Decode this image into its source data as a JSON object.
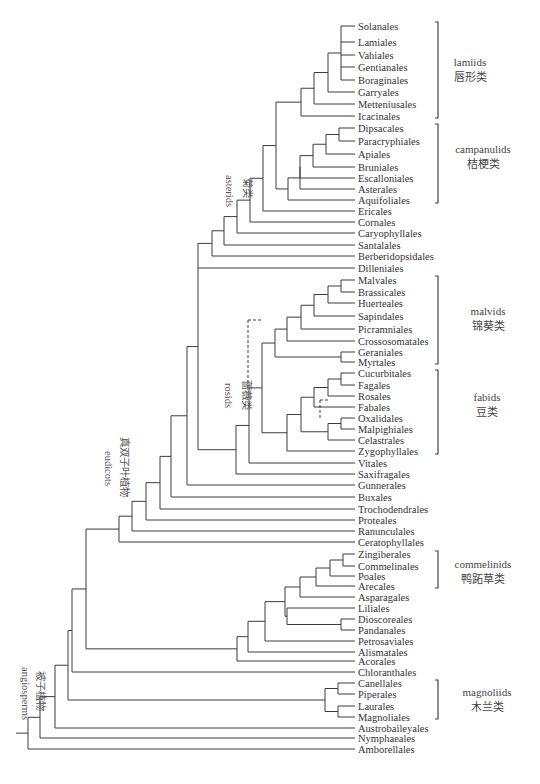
{
  "figure": {
    "type": "phylogenetic_tree",
    "line_color": "#3c3c3c",
    "leaves": [
      {
        "name": "Solanales",
        "y": 26
      },
      {
        "name": "Lamiales",
        "y": 42
      },
      {
        "name": "Vahiales",
        "y": 55
      },
      {
        "name": "Gentianales",
        "y": 67
      },
      {
        "name": "Boraginales",
        "y": 80
      },
      {
        "name": "Garryales",
        "y": 92
      },
      {
        "name": "Metteniusales",
        "y": 104
      },
      {
        "name": "Icacinales",
        "y": 116
      },
      {
        "name": "Dipsacales",
        "y": 128
      },
      {
        "name": "Paracryphiales",
        "y": 141
      },
      {
        "name": "Apiales",
        "y": 154
      },
      {
        "name": "Bruniales",
        "y": 167
      },
      {
        "name": "Escalloniales",
        "y": 178
      },
      {
        "name": "Asterales",
        "y": 189
      },
      {
        "name": "Aquifoliales",
        "y": 200
      },
      {
        "name": "Ericales",
        "y": 211
      },
      {
        "name": "Cornales",
        "y": 222
      },
      {
        "name": "Caryophyllales",
        "y": 233
      },
      {
        "name": "Santalales",
        "y": 245
      },
      {
        "name": "Berberidopsidales",
        "y": 256
      },
      {
        "name": "Dilleniales",
        "y": 268
      },
      {
        "name": "Malvales",
        "y": 280
      },
      {
        "name": "Brassicales",
        "y": 292
      },
      {
        "name": "Huerteales",
        "y": 303
      },
      {
        "name": "Sapindales",
        "y": 316
      },
      {
        "name": "Picramniales",
        "y": 329
      },
      {
        "name": "Crossosomatales",
        "y": 341
      },
      {
        "name": "Geraniales",
        "y": 352
      },
      {
        "name": "Myrtales",
        "y": 362
      },
      {
        "name": "Cucurbitales",
        "y": 373
      },
      {
        "name": "Fagales",
        "y": 385
      },
      {
        "name": "Rosales",
        "y": 396
      },
      {
        "name": "Fabales",
        "y": 407
      },
      {
        "name": "Oxalidales",
        "y": 418
      },
      {
        "name": "Malpighiales",
        "y": 429
      },
      {
        "name": "Celastrales",
        "y": 440
      },
      {
        "name": "Zygophyllales",
        "y": 451
      },
      {
        "name": "Vitales",
        "y": 463
      },
      {
        "name": "Saxifragales",
        "y": 474
      },
      {
        "name": "Gunnerales",
        "y": 485
      },
      {
        "name": "Buxales",
        "y": 497
      },
      {
        "name": "Trochodendrales",
        "y": 509
      },
      {
        "name": "Proteales",
        "y": 520
      },
      {
        "name": "Ranunculales",
        "y": 531
      },
      {
        "name": "Ceratophyllales",
        "y": 542
      },
      {
        "name": "Zingiberales",
        "y": 554
      },
      {
        "name": "Commelinales",
        "y": 566
      },
      {
        "name": "Poales",
        "y": 576
      },
      {
        "name": "Arecales",
        "y": 586
      },
      {
        "name": "Asparagales",
        "y": 597
      },
      {
        "name": "Liliales",
        "y": 608
      },
      {
        "name": "Dioscoreales",
        "y": 619
      },
      {
        "name": "Pandanales",
        "y": 630
      },
      {
        "name": "Petrosaviales",
        "y": 641
      },
      {
        "name": "Alismatales",
        "y": 652
      },
      {
        "name": "Acorales",
        "y": 661
      },
      {
        "name": "Chloranthales",
        "y": 672
      },
      {
        "name": "Canellales",
        "y": 683
      },
      {
        "name": "Piperales",
        "y": 694
      },
      {
        "name": "Laurales",
        "y": 706
      },
      {
        "name": "Magnoliales",
        "y": 717
      },
      {
        "name": "Austrobaileyales",
        "y": 728
      },
      {
        "name": "Nymphaeales",
        "y": 738
      },
      {
        "name": "Amborellales",
        "y": 749
      }
    ],
    "clades": [
      {
        "en": "lamiids",
        "zh": "唇形类",
        "bracket_top": 22,
        "bracket_bottom": 118
      },
      {
        "en": "campanulids",
        "zh": "桔梗类",
        "bracket_top": 124,
        "bracket_bottom": 203
      },
      {
        "en": "malvids",
        "zh": "锦葵类",
        "bracket_top": 276,
        "bracket_bottom": 364
      },
      {
        "en": "fabids",
        "zh": "豆类",
        "bracket_top": 370,
        "bracket_bottom": 454
      },
      {
        "en": "commelinids",
        "zh": "鸭跖草类",
        "bracket_top": 551,
        "bracket_bottom": 588
      },
      {
        "en": "magnoliids",
        "zh": "木兰类",
        "bracket_top": 680,
        "bracket_bottom": 719
      }
    ],
    "node_labels": [
      {
        "en": "asterids",
        "zh": "菊类"
      },
      {
        "en": "rosids",
        "zh": "蔷薇类"
      },
      {
        "en": "eudicots",
        "zh": "真双子叶植物"
      },
      {
        "en": "angiosperms",
        "zh": "被子植物"
      }
    ]
  }
}
